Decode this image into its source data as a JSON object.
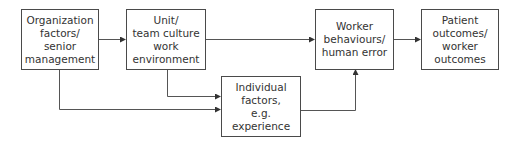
{
  "diagram": {
    "boxes": [
      {
        "id": "org",
        "label": "Organization\nfactors/\nsenior\nmanagement"
      },
      {
        "id": "unit",
        "label": "Unit/\nteam culture\nwork\nenvironment"
      },
      {
        "id": "individual",
        "label": "Individual\nfactors,\ne.g.\nexperience"
      },
      {
        "id": "worker",
        "label": "Worker\nbehaviours/\nhuman error"
      },
      {
        "id": "outcomes",
        "label": "Patient\noutcomes/\nworker\noutcomes"
      }
    ],
    "edges": [
      {
        "from": "org",
        "to": "unit"
      },
      {
        "from": "unit",
        "to": "worker"
      },
      {
        "from": "org",
        "to": "individual"
      },
      {
        "from": "unit",
        "to": "individual"
      },
      {
        "from": "individual",
        "to": "worker"
      },
      {
        "from": "worker",
        "to": "outcomes"
      }
    ],
    "colors": {
      "line": "#4a4a4a",
      "text": "#333333",
      "background": "#ffffff"
    }
  }
}
